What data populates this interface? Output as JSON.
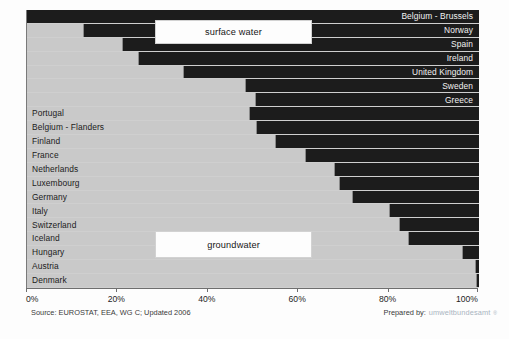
{
  "chart_data": {
    "type": "bar",
    "orientation": "horizontal",
    "stacked": true,
    "title": "",
    "xlabel": "",
    "ylabel": "",
    "xlim": [
      0,
      100
    ],
    "xticks": [
      "0%",
      "20%",
      "40%",
      "60%",
      "80%",
      "100%"
    ],
    "xtick_values": [
      0,
      20,
      40,
      60,
      80,
      100
    ],
    "grid": false,
    "legend_position": "inside-overlay",
    "series": [
      {
        "name": "groundwater",
        "color": "#c9c9c9",
        "values": [
          0,
          12.6,
          21.2,
          24.8,
          34.7,
          48.5,
          50.7,
          49.3,
          50.9,
          55.1,
          61.7,
          68.1,
          69.2,
          72.1,
          80.3,
          82.5,
          84.5,
          96.5,
          99.3,
          99.6
        ]
      },
      {
        "name": "surface water",
        "color": "#1c1c1c",
        "values": [
          100,
          87.4,
          78.8,
          75.2,
          65.3,
          51.5,
          49.3,
          50.7,
          49.1,
          44.9,
          38.3,
          31.9,
          30.8,
          27.9,
          19.7,
          17.5,
          15.5,
          3.5,
          0.7,
          0.4
        ]
      }
    ],
    "categories": [
      "Belgium - Brussels",
      "Norway",
      "Spain",
      "Ireland",
      "United Kingdom",
      "Sweden",
      "Greece",
      "Portugal",
      "Belgium - Flanders",
      "Finland",
      "France",
      "Netherlands",
      "Luxembourg",
      "Germany",
      "Italy",
      "Switzerland",
      "Iceland",
      "Hungary",
      "Austria",
      "Denmark"
    ]
  },
  "rows": [
    {
      "label": "Belgium - Brussels",
      "groundwater": 0,
      "label_side": "right"
    },
    {
      "label": "Norway",
      "groundwater": 12.6,
      "label_side": "right"
    },
    {
      "label": "Spain",
      "groundwater": 21.2,
      "label_side": "right"
    },
    {
      "label": "Ireland",
      "groundwater": 24.8,
      "label_side": "right"
    },
    {
      "label": "United Kingdom",
      "groundwater": 34.7,
      "label_side": "right"
    },
    {
      "label": "Sweden",
      "groundwater": 48.5,
      "label_side": "right"
    },
    {
      "label": "Greece",
      "groundwater": 50.7,
      "label_side": "right"
    },
    {
      "label": "Portugal",
      "groundwater": 49.3,
      "label_side": "left"
    },
    {
      "label": "Belgium - Flanders",
      "groundwater": 50.9,
      "label_side": "left"
    },
    {
      "label": "Finland",
      "groundwater": 55.1,
      "label_side": "left"
    },
    {
      "label": "France",
      "groundwater": 61.7,
      "label_side": "left"
    },
    {
      "label": "Netherlands",
      "groundwater": 68.1,
      "label_side": "left"
    },
    {
      "label": "Luxembourg",
      "groundwater": 69.2,
      "label_side": "left"
    },
    {
      "label": "Germany",
      "groundwater": 72.1,
      "label_side": "left"
    },
    {
      "label": "Italy",
      "groundwater": 80.3,
      "label_side": "left"
    },
    {
      "label": "Switzerland",
      "groundwater": 82.5,
      "label_side": "left"
    },
    {
      "label": "Iceland",
      "groundwater": 84.5,
      "label_side": "left"
    },
    {
      "label": "Hungary",
      "groundwater": 96.5,
      "label_side": "left"
    },
    {
      "label": "Austria",
      "groundwater": 99.3,
      "label_side": "left"
    },
    {
      "label": "Denmark",
      "groundwater": 99.6,
      "label_side": "left"
    }
  ],
  "legend": {
    "surface_water": "surface water",
    "groundwater": "groundwater"
  },
  "footer": {
    "source": "Source: EUROSTAT, EEA, WG C; Updated 2006",
    "prepared_label": "Prepared by:",
    "prepared_brand": "umweltbundesamt",
    "prepared_mark": "®"
  },
  "colors": {
    "surface_water": "#1c1c1c",
    "groundwater": "#c9c9c9",
    "brand": "#a9b4bf",
    "axis": "#6e6e6e"
  }
}
